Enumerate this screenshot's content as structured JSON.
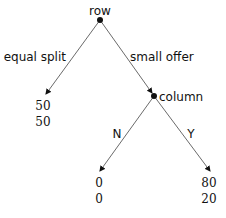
{
  "diagram": {
    "type": "game-tree",
    "colors": {
      "ink": "#111111",
      "edge": "#444444",
      "background": "#ffffff"
    },
    "nodes": [
      {
        "id": "root",
        "label": "row",
        "x": 100,
        "y": 20
      },
      {
        "id": "column",
        "label": "column",
        "x": 154,
        "y": 96
      }
    ],
    "edges": [
      {
        "from": "root",
        "label": "equal split",
        "x1": 100,
        "y1": 20,
        "x2": 46,
        "y2": 94
      },
      {
        "from": "root",
        "label": "small offer",
        "x1": 100,
        "y1": 20,
        "x2": 154,
        "y2": 96
      },
      {
        "from": "column",
        "label": "N",
        "x1": 154,
        "y1": 96,
        "x2": 100,
        "y2": 171
      },
      {
        "from": "column",
        "label": "Y",
        "x1": 154,
        "y1": 96,
        "x2": 210,
        "y2": 171
      }
    ],
    "leaves": [
      {
        "id": "leaf-equal-split",
        "payoffs": [
          "50",
          "50"
        ]
      },
      {
        "id": "leaf-N",
        "payoffs": [
          "0",
          "0"
        ]
      },
      {
        "id": "leaf-Y",
        "payoffs": [
          "80",
          "20"
        ]
      }
    ]
  }
}
